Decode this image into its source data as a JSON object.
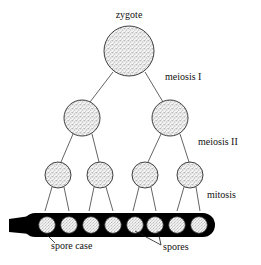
{
  "diagram": {
    "title": "zygote",
    "background_color": "#ffffff",
    "ink_color": "#000000",
    "spore_case_color": "#000000",
    "cell_fill": "stippled-gray",
    "labels": {
      "zygote": "zygote",
      "meiosis_i": "meiosis I",
      "meiosis_ii": "meiosis II",
      "mitosis": "mitosis",
      "spore_case": "spore case",
      "spores": "spores"
    },
    "stages": [
      {
        "name": "zygote",
        "label": "zygote",
        "cell_count": 1,
        "radius": 25,
        "cy": 51,
        "cx": [
          129
        ]
      },
      {
        "name": "meiosis-i-products",
        "label": "meiosis I",
        "cell_count": 2,
        "radius": 18,
        "cy": 118,
        "cx": [
          82,
          170
        ]
      },
      {
        "name": "meiosis-ii-products",
        "label": "meiosis II",
        "cell_count": 4,
        "radius": 13,
        "cy": 175,
        "cx": [
          58,
          100,
          145,
          190
        ]
      },
      {
        "name": "spores",
        "label": "mitosis",
        "cell_count": 8,
        "radius": 8,
        "cy": 225,
        "cx": [
          47,
          69,
          91,
          113,
          135,
          155,
          177,
          199
        ]
      }
    ],
    "label_positions": {
      "zygote": {
        "x": 129,
        "y": 16,
        "anchor": "middle"
      },
      "meiosis_i": {
        "x": 165,
        "y": 78,
        "anchor": "start"
      },
      "meiosis_ii": {
        "x": 198,
        "y": 143,
        "anchor": "start"
      },
      "mitosis": {
        "x": 207,
        "y": 196,
        "anchor": "start"
      },
      "spore_case": {
        "x": 51,
        "y": 247,
        "anchor": "start"
      },
      "spores": {
        "x": 163,
        "y": 248,
        "anchor": "start"
      }
    },
    "spore_case_geometry": {
      "left": 23,
      "right": 215,
      "top": 213,
      "bottom": 237,
      "stalk_left": 9,
      "stalk_top": 219,
      "stalk_bottom": 232
    }
  }
}
